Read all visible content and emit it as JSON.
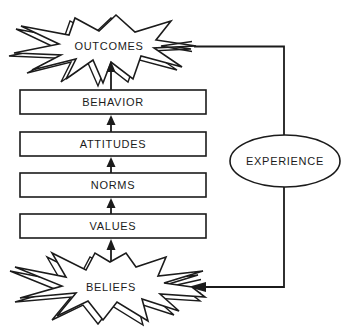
{
  "diagram": {
    "nodes": {
      "outcomes": "OUTCOMES",
      "behavior": "BEHAVIOR",
      "attitudes": "ATTITUDES",
      "norms": "NORMS",
      "values": "VALUES",
      "beliefs": "BELIEFS",
      "experience": "EXPERIENCE"
    },
    "colors": {
      "stroke": "#1b1b1b",
      "fill": "#ffffff",
      "background": "#ffffff"
    }
  }
}
